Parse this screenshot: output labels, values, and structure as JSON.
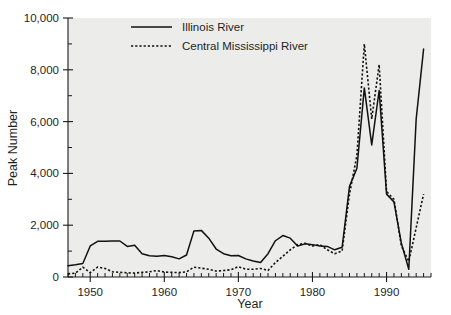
{
  "chart_data": {
    "type": "line",
    "title": "",
    "xlabel": "Year",
    "ylabel": "Peak Number",
    "xlim": [
      1947,
      1996
    ],
    "ylim": [
      0,
      10000
    ],
    "grid": false,
    "legend_position": "top-center",
    "x_ticks_major": [
      1950,
      1960,
      1970,
      1980,
      1990
    ],
    "x_tick_labels": [
      "1950",
      "1960",
      "1970",
      "1980",
      "1990"
    ],
    "x_tick_minor_step": 1,
    "y_ticks_major": [
      0,
      2000,
      4000,
      6000,
      8000,
      10000
    ],
    "y_tick_labels": [
      "0",
      "2,000",
      "4,000",
      "6,000",
      "8,000",
      "10,000"
    ],
    "y_ticks_minor": [
      1000,
      3000,
      5000,
      7000,
      9000
    ],
    "x": [
      1947,
      1948,
      1949,
      1950,
      1951,
      1952,
      1953,
      1954,
      1955,
      1956,
      1957,
      1958,
      1959,
      1960,
      1961,
      1962,
      1963,
      1964,
      1965,
      1966,
      1967,
      1968,
      1969,
      1970,
      1971,
      1972,
      1973,
      1974,
      1975,
      1976,
      1977,
      1978,
      1979,
      1980,
      1981,
      1982,
      1983,
      1984,
      1985,
      1986,
      1987,
      1988,
      1989,
      1990,
      1991,
      1992,
      1993,
      1994,
      1995
    ],
    "series": [
      {
        "name": "Illinois River",
        "style": "solid",
        "values": [
          430,
          470,
          520,
          1200,
          1380,
          1380,
          1390,
          1390,
          1180,
          1230,
          900,
          820,
          800,
          830,
          780,
          700,
          850,
          1780,
          1800,
          1500,
          1080,
          900,
          820,
          830,
          700,
          620,
          560,
          900,
          1400,
          1600,
          1500,
          1200,
          1280,
          1250,
          1200,
          1180,
          1050,
          1150,
          3500,
          4200,
          7300,
          5100,
          7200,
          3200,
          2900,
          1300,
          300,
          6100,
          8800
        ]
      },
      {
        "name": "Central Mississippi River",
        "style": "dotted",
        "values": [
          120,
          150,
          380,
          170,
          380,
          330,
          200,
          180,
          160,
          150,
          180,
          200,
          250,
          190,
          180,
          170,
          200,
          380,
          340,
          300,
          230,
          250,
          280,
          400,
          300,
          300,
          330,
          250,
          560,
          800,
          1050,
          1250,
          1300,
          1200,
          1250,
          1050,
          900,
          1000,
          3200,
          4700,
          9000,
          6100,
          8200,
          3300,
          3000,
          1200,
          600,
          1900,
          3200
        ]
      }
    ]
  },
  "legend": {
    "items": [
      {
        "label": "Illinois River",
        "style": "solid"
      },
      {
        "label": "Central Mississippi River",
        "style": "dotted"
      }
    ]
  }
}
